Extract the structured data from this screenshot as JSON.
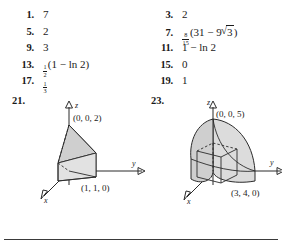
{
  "page": {
    "type": "textbook-answer-key",
    "divider_color": "#3a3a3a",
    "background": "#ffffff"
  },
  "answers": {
    "left_column": [
      {
        "number": "1.",
        "value": "7"
      },
      {
        "number": "5.",
        "value": "2"
      },
      {
        "number": "9.",
        "value": "3"
      },
      {
        "number": "13.",
        "value": "(1  −  ln 2)",
        "fraction": {
          "numerator": "1",
          "denominator": "2"
        }
      },
      {
        "number": "17.",
        "value": "",
        "fraction": {
          "numerator": "1",
          "denominator": "3"
        }
      }
    ],
    "right_column": [
      {
        "number": "3.",
        "value": "2"
      },
      {
        "number": "7.",
        "value": "(31  −  9",
        "fraction": {
          "numerator": "8",
          "denominator": "15"
        },
        "radicand": "3",
        "value_tail": ")"
      },
      {
        "number": "11.",
        "value": "1  −  ln 2"
      },
      {
        "number": "15.",
        "value": "0"
      },
      {
        "number": "19.",
        "value": "1"
      }
    ]
  },
  "figures": {
    "figure_21": {
      "number": "21.",
      "axis_z": "z",
      "axis_y": "y",
      "axis_x": "x",
      "vertex_top": "(0, 0, 2)",
      "vertex_base": "(1, 1, 0)",
      "shape": "tetrahedron",
      "fill_color": "#d9d9d9",
      "stroke_color": "#2b2b2b"
    },
    "figure_23": {
      "number": "23.",
      "axis_z": "z",
      "axis_y": "y",
      "axis_x": "x",
      "vertex_top": "(0, 0, 5)",
      "vertex_base": "(3, 4, 0)",
      "shape": "quarter-dome-solid",
      "fill_color": "#dcdcdc",
      "stroke_color": "#2b2b2b"
    }
  }
}
